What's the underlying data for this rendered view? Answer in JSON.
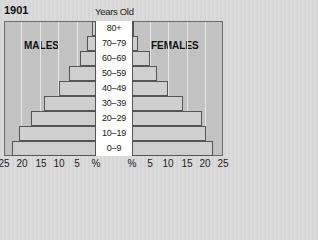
{
  "header": {
    "year": "1901",
    "axis_title": "Years Old"
  },
  "labels": {
    "males": "MALES",
    "females": "FEMALES"
  },
  "colors": {
    "panel": "#c3c3c3",
    "bar": "#cfcfcf",
    "label_bg": "#ffffff"
  },
  "chart_data": {
    "type": "bar",
    "subtype": "population_pyramid",
    "title": "1901",
    "ylabel": "Years Old",
    "xlabel": "%",
    "categories": [
      "0–9",
      "10–19",
      "20–29",
      "30–39",
      "40–49",
      "50–59",
      "60–69",
      "70–79",
      "80+"
    ],
    "series": [
      {
        "name": "MALES",
        "values": [
          22.8,
          21.0,
          17.7,
          14.0,
          10.0,
          7.3,
          4.3,
          2.4,
          1.0
        ]
      },
      {
        "name": "FEMALES",
        "values": [
          22.2,
          20.3,
          19.2,
          14.0,
          9.9,
          6.9,
          4.9,
          1.6,
          0.6
        ]
      }
    ],
    "xlim": [
      0,
      25
    ],
    "x_ticks_left": [
      "25",
      "20",
      "15",
      "10",
      "5",
      "%"
    ],
    "x_ticks_right": [
      "%",
      "5",
      "10",
      "15",
      "20",
      "25"
    ],
    "grid": true
  }
}
